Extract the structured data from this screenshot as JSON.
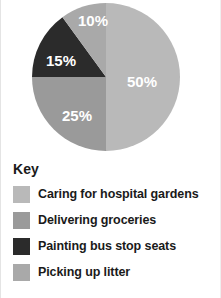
{
  "chart_data": {
    "type": "pie",
    "title": "",
    "legend_title": "Key",
    "legend_position": "bottom",
    "start_angle_deg": 0,
    "direction": "clockwise",
    "units": "percent",
    "total": 100,
    "categories": [
      "Caring for hospital gardens",
      "Delivering groceries",
      "Painting bus stop seats",
      "Picking up litter"
    ],
    "values": [
      50,
      25,
      15,
      10
    ],
    "data_labels": [
      "50%",
      "25%",
      "15%",
      "10%"
    ],
    "colors": [
      "#b9b9b9",
      "#9a9a9a",
      "#2b2b2b",
      "#a9a9a9"
    ],
    "slices": [
      {
        "label": "Caring for hospital gardens",
        "value": 50,
        "data_label": "50%",
        "color": "#b9b9b9",
        "start_deg": 0,
        "end_deg": 180,
        "label_x": 141,
        "label_y": 83
      },
      {
        "label": "Delivering groceries",
        "value": 25,
        "data_label": "25%",
        "color": "#9a9a9a",
        "start_deg": 180,
        "end_deg": 270,
        "label_x": 76,
        "label_y": 117
      },
      {
        "label": "Painting bus stop seats",
        "value": 15,
        "data_label": "15%",
        "color": "#2b2b2b",
        "start_deg": 270,
        "end_deg": 324,
        "label_x": 60,
        "label_y": 62
      },
      {
        "label": "Picking up litter",
        "value": 10,
        "data_label": "10%",
        "color": "#a9a9a9",
        "start_deg": 324,
        "end_deg": 360,
        "label_x": 92,
        "label_y": 22
      }
    ],
    "geometry": {
      "cx": 105,
      "cy": 77,
      "r": 74
    }
  },
  "legend": {
    "title": "Key",
    "items": [
      {
        "label": "Caring for hospital gardens",
        "color": "#b9b9b9"
      },
      {
        "label": "Delivering groceries",
        "color": "#9a9a9a"
      },
      {
        "label": "Painting bus stop seats",
        "color": "#2b2b2b"
      },
      {
        "label": "Picking up litter",
        "color": "#a9a9a9"
      }
    ]
  }
}
